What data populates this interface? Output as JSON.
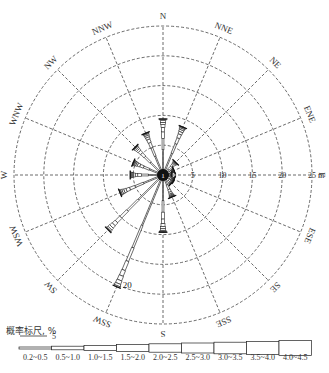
{
  "chart_data": {
    "type": "wind-rose",
    "title": "",
    "directions": [
      "N",
      "NNE",
      "NE",
      "ENE",
      "E",
      "ESE",
      "SE",
      "SSE",
      "S",
      "SSW",
      "SW",
      "WSW",
      "W",
      "WNW",
      "NW",
      "NNW"
    ],
    "frequency_percent": [
      9.4,
      8.7,
      3.0,
      2.0,
      1.5,
      2.0,
      2.0,
      4.0,
      9.6,
      20.3,
      13.0,
      7.8,
      5.5,
      5.4,
      6.6,
      7.6
    ],
    "radial_ticks": [
      5,
      10,
      15,
      20,
      25
    ],
    "radial_unit": "m",
    "radial_max": 25,
    "annotation": {
      "text": "20",
      "direction": "SSW"
    },
    "grid": true,
    "calm_center_label": "1",
    "legend": {
      "title": "概率标尺, %",
      "scale_bar_label": "5",
      "speed_classes": [
        "0.2~0.5",
        "0.5~1.0",
        "1.0~1.5",
        "1.5~2.0",
        "2.0~2.5",
        "2.5~3.0",
        "3.0~3.5",
        "3.5~4.0",
        "4.0~4.5"
      ]
    }
  },
  "colors": {
    "line": "#333333",
    "grid": "#444444",
    "background": "#ffffff"
  }
}
